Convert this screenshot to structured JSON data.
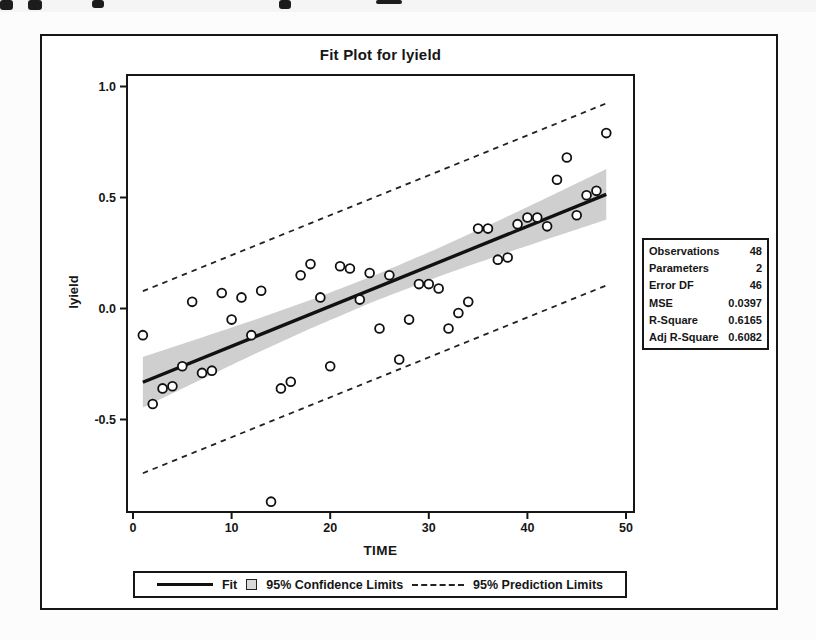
{
  "chart_data": {
    "type": "scatter",
    "title": "Fit Plot for lyield",
    "xlabel": "TIME",
    "ylabel": "lyield",
    "x_ticks": [
      "0",
      "10",
      "20",
      "30",
      "40",
      "50"
    ],
    "y_ticks": [
      "1.0",
      "0.5",
      "0.0",
      "-0.5"
    ],
    "xlim": [
      -0.6,
      50.8
    ],
    "ylim": [
      -0.92,
      1.05
    ],
    "grid": false,
    "legend_position": "bottom",
    "points": {
      "x": [
        1,
        2,
        3,
        4,
        5,
        6,
        7,
        8,
        9,
        10,
        11,
        12,
        13,
        14,
        15,
        16,
        17,
        18,
        19,
        20,
        21,
        22,
        23,
        24,
        25,
        26,
        27,
        28,
        29,
        30,
        31,
        32,
        33,
        34,
        35,
        36,
        37,
        38,
        39,
        40,
        41,
        42,
        43,
        44,
        45,
        46,
        47,
        48
      ],
      "y": [
        -0.12,
        -0.43,
        -0.36,
        -0.35,
        -0.26,
        0.03,
        -0.29,
        -0.28,
        0.07,
        -0.05,
        0.05,
        -0.12,
        0.08,
        -0.87,
        -0.36,
        -0.33,
        0.15,
        0.2,
        0.05,
        -0.26,
        0.19,
        0.18,
        0.04,
        0.16,
        -0.09,
        0.15,
        -0.23,
        -0.05,
        0.11,
        0.11,
        0.09,
        -0.09,
        -0.02,
        0.03,
        0.36,
        0.36,
        0.22,
        0.23,
        0.38,
        0.41,
        0.41,
        0.37,
        0.58,
        0.68,
        0.42,
        0.51,
        0.53,
        0.79
      ]
    },
    "fit_line": {
      "intercept": -0.35,
      "slope": 0.018,
      "x_start": 1,
      "x_end": 48
    },
    "confidence_band": {
      "t": [
        1,
        6,
        12,
        18,
        24.5,
        31,
        37,
        43,
        48
      ],
      "half_width": [
        0.114,
        0.097,
        0.078,
        0.064,
        0.058,
        0.064,
        0.078,
        0.097,
        0.114
      ]
    },
    "prediction_limit_offset": 0.41,
    "legend": [
      {
        "label": "Fit",
        "swatch": "solid-line"
      },
      {
        "label": "95% Confidence Limits",
        "swatch": "shaded-box"
      },
      {
        "label": "95% Prediction Limits",
        "swatch": "dashed-line"
      }
    ],
    "stats": {
      "rows": [
        [
          "Observations",
          "48"
        ],
        [
          "Parameters",
          "2"
        ],
        [
          "Error DF",
          "46"
        ],
        [
          "MSE",
          "0.0397"
        ],
        [
          "R-Square",
          "0.6165"
        ],
        [
          "Adj R-Square",
          "0.6082"
        ]
      ]
    },
    "colors": {
      "line": "#111111",
      "band_fill": "#cfcfcf",
      "point_stroke": "#111111",
      "frame": "#161616"
    }
  }
}
